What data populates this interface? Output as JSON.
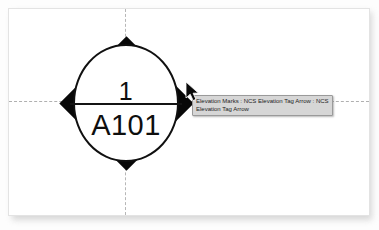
{
  "canvas": {
    "background_color": "#ffffff",
    "border_color": "#e3e3e3"
  },
  "guides": {
    "horizontal_label": "horizontal-construction-line",
    "vertical_label": "vertical-construction-line",
    "color": "#b0b0b0",
    "style": "dashed"
  },
  "symbol": {
    "name": "elevation-tag",
    "shape": "diamond-with-circle",
    "fill_color": "#080808",
    "inner_color": "#ffffff",
    "detail_number": "1",
    "sheet_number": "A101"
  },
  "tooltip": {
    "line1": "Elevation Marks : NCS Elevation Tag Arrow : NCS",
    "line2": "Elevation Tag Arrow",
    "background_color": "#d6d6d6",
    "border_color": "#9a9a9a",
    "text_color": "#1d1d1d"
  },
  "cursor": {
    "icon": "arrow-pointer-icon",
    "color": "#000000"
  }
}
